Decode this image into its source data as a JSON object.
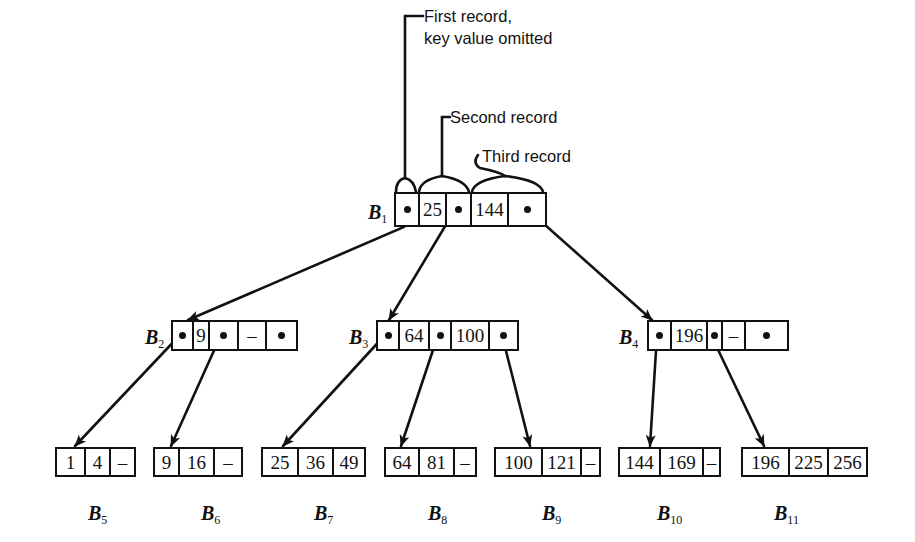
{
  "annotations": {
    "first_record_line1": "First record,",
    "first_record_line2": "key value omitted",
    "second_record": "Second record",
    "third_record": "Third record"
  },
  "nodes": {
    "B1": {
      "letter": "B",
      "sub": "1",
      "cells": [
        "•",
        "25",
        "•",
        "144",
        "•"
      ]
    },
    "B2": {
      "letter": "B",
      "sub": "2",
      "cells": [
        "•",
        "9",
        "•",
        "–",
        "•"
      ]
    },
    "B3": {
      "letter": "B",
      "sub": "3",
      "cells": [
        "•",
        "64",
        "•",
        "100",
        "•"
      ]
    },
    "B4": {
      "letter": "B",
      "sub": "4",
      "cells": [
        "•",
        "196",
        "•",
        "–",
        "•"
      ]
    },
    "B5": {
      "letter": "B",
      "sub": "5",
      "cells": [
        "1",
        "4",
        "–"
      ]
    },
    "B6": {
      "letter": "B",
      "sub": "6",
      "cells": [
        "9",
        "16",
        "–"
      ]
    },
    "B7": {
      "letter": "B",
      "sub": "7",
      "cells": [
        "25",
        "36",
        "49"
      ]
    },
    "B8": {
      "letter": "B",
      "sub": "8",
      "cells": [
        "64",
        "81",
        "–"
      ]
    },
    "B9": {
      "letter": "B",
      "sub": "9",
      "cells": [
        "100",
        "121",
        "–"
      ]
    },
    "B10": {
      "letter": "B",
      "sub": "10",
      "cells": [
        "144",
        "169",
        "–"
      ]
    },
    "B11": {
      "letter": "B",
      "sub": "11",
      "cells": [
        "196",
        "225",
        "256"
      ]
    }
  },
  "edges": [
    {
      "from": "B1.ptr0",
      "to": "B2"
    },
    {
      "from": "B1.ptr1",
      "to": "B3"
    },
    {
      "from": "B1.ptr2",
      "to": "B4"
    },
    {
      "from": "B2.ptr0",
      "to": "B5"
    },
    {
      "from": "B2.ptr1",
      "to": "B6"
    },
    {
      "from": "B3.ptr0",
      "to": "B7"
    },
    {
      "from": "B3.ptr1",
      "to": "B8"
    },
    {
      "from": "B3.ptr2",
      "to": "B9"
    },
    {
      "from": "B4.ptr0",
      "to": "B10"
    },
    {
      "from": "B4.ptr1",
      "to": "B11"
    }
  ]
}
